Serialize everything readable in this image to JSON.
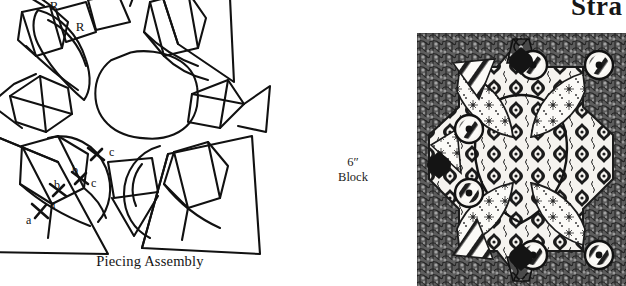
{
  "page": {
    "background_color": "#ffffff",
    "ink_color": "#111111",
    "width": 626,
    "height": 286
  },
  "section_heading": {
    "text": "Stra",
    "note_clipped": "clipped at right page edge"
  },
  "diagram": {
    "caption": "Piecing Assembly",
    "reverse_labels": [
      {
        "id": "R-outer",
        "text": "R"
      },
      {
        "id": "R-inner",
        "text": "R"
      }
    ],
    "match_points": [
      {
        "text": "a"
      },
      {
        "text": "a"
      },
      {
        "text": "b"
      },
      {
        "text": "b"
      },
      {
        "text": "c"
      },
      {
        "text": "c"
      }
    ]
  },
  "block_label": {
    "size": "6″",
    "word": "Block"
  },
  "photo": {
    "alt_name": "finished-quilt-block-photograph",
    "background_print_color": "#6f6f6f",
    "motif_color": "#141414",
    "cloth_color": "#f4f2ee"
  }
}
